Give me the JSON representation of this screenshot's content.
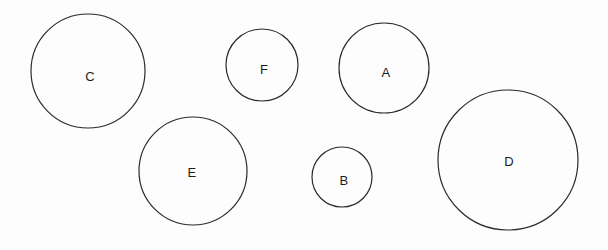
{
  "figure": {
    "width": 608,
    "height": 250,
    "background_color": "#fdfdfd",
    "stroke_color": "#2b2b2b",
    "label_color": "#1c1c1c"
  },
  "chart_data": {
    "type": "scatter",
    "xlabel": "",
    "ylabel": "",
    "xlim": [
      0,
      608
    ],
    "ylim": [
      0,
      250
    ],
    "grid": false,
    "legend": "none",
    "annotations": [
      "Six outlined circles of differing sizes, each labeled with a single capital letter"
    ],
    "series": [
      {
        "name": "circles",
        "points": [
          {
            "label": "C",
            "cx": 88,
            "cy": 71,
            "r": 57,
            "label_x": 90,
            "label_y": 76
          },
          {
            "label": "F",
            "cx": 262,
            "cy": 65,
            "r": 36,
            "label_x": 264,
            "label_y": 69
          },
          {
            "label": "A",
            "cx": 384,
            "cy": 68,
            "r": 45,
            "label_x": 386,
            "label_y": 72
          },
          {
            "label": "E",
            "cx": 193,
            "cy": 171,
            "r": 54,
            "label_x": 192,
            "label_y": 172
          },
          {
            "label": "B",
            "cx": 342,
            "cy": 177,
            "r": 30,
            "label_x": 344,
            "label_y": 180
          },
          {
            "label": "D",
            "cx": 508,
            "cy": 160,
            "r": 70,
            "label_x": 509,
            "label_y": 161
          }
        ]
      }
    ]
  },
  "circles": [
    {
      "id": "circle-c",
      "label": "C",
      "cx": 88,
      "cy": 71,
      "r": 57,
      "label_x": 90,
      "label_y": 76
    },
    {
      "id": "circle-f",
      "label": "F",
      "cx": 262,
      "cy": 65,
      "r": 36,
      "label_x": 264,
      "label_y": 69
    },
    {
      "id": "circle-a",
      "label": "A",
      "cx": 384,
      "cy": 68,
      "r": 45,
      "label_x": 386,
      "label_y": 72
    },
    {
      "id": "circle-e",
      "label": "E",
      "cx": 193,
      "cy": 171,
      "r": 54,
      "label_x": 192,
      "label_y": 172
    },
    {
      "id": "circle-b",
      "label": "B",
      "cx": 342,
      "cy": 177,
      "r": 30,
      "label_x": 344,
      "label_y": 180
    },
    {
      "id": "circle-d",
      "label": "D",
      "cx": 508,
      "cy": 160,
      "r": 70,
      "label_x": 509,
      "label_y": 161
    }
  ]
}
